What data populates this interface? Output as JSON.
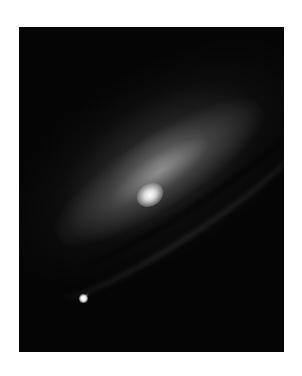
{
  "image": {
    "subject": "spiral galaxy with dust lane and foreground star",
    "palette": {
      "background": "#ffffff",
      "sky": "#050505",
      "core": "#ffffff"
    }
  }
}
